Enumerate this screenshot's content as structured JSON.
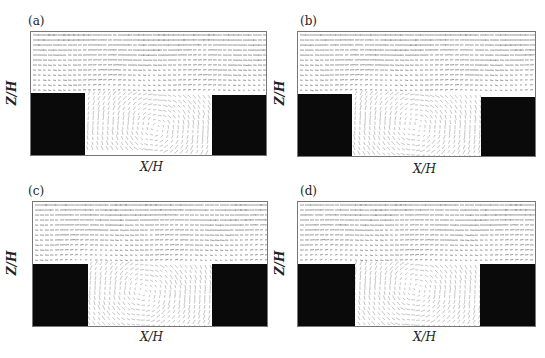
{
  "chart_data": [
    {
      "type": "vector_field",
      "panel_label": "(a)",
      "xlabel": "X/H",
      "ylabel": "Z/H",
      "description": "Velocity vector field over street canyon between two black building blocks; skimming flow aloft, recirculating vortex inside canyon",
      "buildings": [
        {
          "side": "left"
        },
        {
          "side": "right"
        }
      ],
      "vortex_center_rel": [
        0.55,
        0.55
      ]
    },
    {
      "type": "vector_field",
      "panel_label": "(b)",
      "xlabel": "X/H",
      "ylabel": "Z/H",
      "description": "Velocity vector field with single canyon vortex, flow dipping into canyon near center",
      "buildings": [
        {
          "side": "left"
        },
        {
          "side": "right"
        }
      ],
      "vortex_center_rel": [
        0.5,
        0.5
      ]
    },
    {
      "type": "vector_field",
      "panel_label": "(c)",
      "xlabel": "X/H",
      "ylabel": "Z/H",
      "description": "Velocity vector field with recirculation in canyon, stronger shear layer at roof level",
      "buildings": [
        {
          "side": "left"
        },
        {
          "side": "right"
        }
      ],
      "vortex_center_rel": [
        0.45,
        0.45
      ]
    },
    {
      "type": "vector_field",
      "panel_label": "(d)",
      "xlabel": "X/H",
      "ylabel": "Z/H",
      "description": "Velocity vector field with canyon vortex displaced toward leeward side",
      "buildings": [
        {
          "side": "left"
        },
        {
          "side": "right"
        }
      ],
      "vortex_center_rel": [
        0.5,
        0.4
      ]
    }
  ],
  "panels": [
    {
      "label": "(a)",
      "xlabel": "X/H",
      "ylabel": "Z/H"
    },
    {
      "label": "(b)",
      "xlabel": "X/H",
      "ylabel": "Z/H"
    },
    {
      "label": "(c)",
      "xlabel": "X/H",
      "ylabel": "Z/H"
    },
    {
      "label": "(d)",
      "xlabel": "X/H",
      "ylabel": "Z/H"
    }
  ],
  "colors": {
    "building": "#0a0a0a",
    "vector": "#555555",
    "frame": "#777777"
  }
}
